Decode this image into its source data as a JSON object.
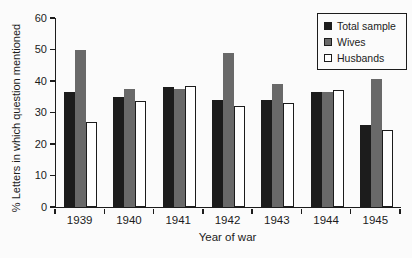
{
  "figure": {
    "background": "#fbfbfb",
    "axis_color": "#1c1c1c"
  },
  "chart_data": {
    "type": "bar",
    "title": "",
    "xlabel": "Year of war",
    "ylabel": "% Letters in which question mentioned",
    "ylim": [
      0,
      60
    ],
    "yticks": [
      0,
      10,
      20,
      30,
      40,
      50,
      60
    ],
    "categories": [
      "1939",
      "1940",
      "1941",
      "1942",
      "1943",
      "1944",
      "1945"
    ],
    "series": [
      {
        "name": "Total sample",
        "color": "#1c1c1c",
        "outline": "#1c1c1c",
        "values": [
          36.5,
          35,
          38,
          34,
          34,
          36.5,
          26
        ]
      },
      {
        "name": "Wives",
        "color": "#696969",
        "outline": "#1c1c1c",
        "values": [
          50,
          37.5,
          37.5,
          49,
          39,
          36.5,
          40.5
        ]
      },
      {
        "name": "Husbands",
        "color": "#ffffff",
        "outline": "#1c1c1c",
        "values": [
          27,
          33.5,
          38.5,
          32,
          33,
          37,
          24.5
        ]
      }
    ],
    "legend_position": "top-right",
    "grid": false
  }
}
